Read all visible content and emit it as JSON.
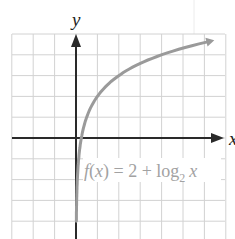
{
  "chart_data": {
    "type": "line",
    "title": "",
    "function": "f(x) = 2 + log_2 x",
    "xlabel": "x",
    "ylabel": "y",
    "xlim": [
      -3,
      7
    ],
    "ylim": [
      -4.4,
      5
    ],
    "grid": true,
    "grid_step": 1,
    "series": [
      {
        "name": "f(x) = 2 + log₂ x",
        "x": [
          0.0625,
          0.125,
          0.25,
          0.5,
          1,
          2,
          4,
          6.3
        ],
        "y": [
          -2,
          -1,
          0,
          1,
          2,
          3,
          4,
          4.66
        ]
      }
    ],
    "annotations": [
      {
        "text": "f(x) = 2 + log₂ x",
        "position": "below x-axis, right of y-axis"
      }
    ],
    "axes": {
      "x_arrow": true,
      "y_arrow": true
    }
  },
  "labels": {
    "x_axis": "x",
    "y_axis": "y",
    "fn_f": "f",
    "fn_open": "(",
    "fn_x": "x",
    "fn_close": ")",
    "fn_mid": " = 2 + log",
    "fn_sub": "2",
    "fn_end_x": "x"
  },
  "colors": {
    "grid": "#d2d2d2",
    "axis": "#2a2a2a",
    "curve": "#9a9a9a",
    "label": "#a2a2a2"
  }
}
